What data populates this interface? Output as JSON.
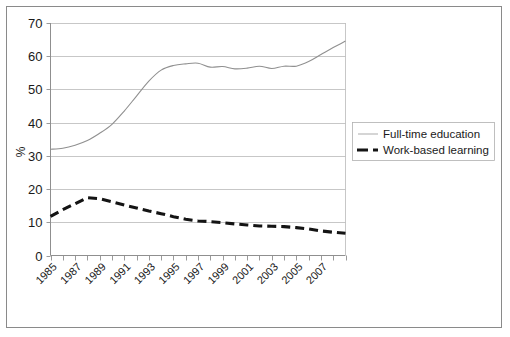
{
  "chart_data": {
    "type": "line",
    "title": "",
    "subtitle": "",
    "xlabel": "",
    "ylabel": "%",
    "xlim": [
      1985,
      2009
    ],
    "ylim": [
      0,
      70
    ],
    "grid": true,
    "legend_position": "right",
    "x": [
      1985,
      1986,
      1987,
      1988,
      1989,
      1990,
      1991,
      1992,
      1993,
      1994,
      1995,
      1996,
      1997,
      1998,
      1999,
      2000,
      2001,
      2002,
      2003,
      2004,
      2005,
      2006,
      2007,
      2008,
      2009
    ],
    "xtick_values": [
      1985,
      1986,
      1987,
      1988,
      1989,
      1990,
      1991,
      1992,
      1993,
      1994,
      1995,
      1996,
      1997,
      1998,
      1999,
      2000,
      2001,
      2002,
      2003,
      2004,
      2005,
      2006,
      2007,
      2008,
      2009
    ],
    "xtick_labels": [
      "1985",
      "1987",
      "1989",
      "1991",
      "1993",
      "1995",
      "1997",
      "1999",
      "2001",
      "2003",
      "2005",
      "2007"
    ],
    "xtick_label_values": [
      1985,
      1987,
      1989,
      1991,
      1993,
      1995,
      1997,
      1999,
      2001,
      2003,
      2005,
      2007
    ],
    "ytick_labels": [
      "0",
      "10",
      "20",
      "30",
      "40",
      "50",
      "60",
      "70"
    ],
    "ytick_values": [
      0,
      10,
      20,
      30,
      40,
      50,
      60,
      70
    ],
    "series": [
      {
        "name": "Full-time education",
        "style": "solid",
        "color": "#909090",
        "values": [
          32.0,
          32.3,
          33.2,
          34.6,
          36.8,
          39.5,
          43.5,
          48.0,
          52.5,
          55.8,
          57.2,
          57.7,
          57.9,
          56.7,
          56.9,
          56.2,
          56.4,
          57.0,
          56.3,
          57.0,
          57.0,
          58.4,
          60.5,
          62.6,
          64.6
        ]
      },
      {
        "name": "Work-based learning",
        "style": "dashed",
        "color": "#141414",
        "values": [
          11.8,
          13.8,
          15.6,
          17.4,
          17.1,
          16.2,
          15.2,
          14.3,
          13.4,
          12.6,
          11.7,
          10.9,
          10.4,
          10.2,
          9.9,
          9.5,
          9.2,
          8.9,
          8.8,
          8.7,
          8.4,
          8.0,
          7.4,
          7.0,
          6.7
        ]
      }
    ]
  },
  "legend": {
    "entries": [
      {
        "label": "Full-time education",
        "marker": "solid-line"
      },
      {
        "label": "Work-based learning",
        "marker": "dashed-line"
      }
    ]
  },
  "axes": {
    "y_axis_title": "%"
  }
}
